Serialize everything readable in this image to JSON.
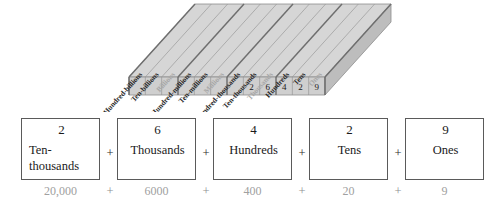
{
  "chart": {
    "name": "place-value-chart",
    "columns": [
      {
        "label": "Hundred-billions",
        "muted": false,
        "digit": ""
      },
      {
        "label": "Ten-billions",
        "muted": false,
        "digit": ""
      },
      {
        "label": "Billions",
        "muted": true,
        "digit": ""
      },
      {
        "label": "Hundred-millions",
        "muted": false,
        "digit": ""
      },
      {
        "label": "Ten-millions",
        "muted": false,
        "digit": ""
      },
      {
        "label": "Millions",
        "muted": true,
        "digit": ""
      },
      {
        "label": "Hundred-thousands",
        "muted": false,
        "digit": ""
      },
      {
        "label": "Ten-thousands",
        "muted": false,
        "digit": "2"
      },
      {
        "label": "Thousands",
        "muted": true,
        "digit": "6"
      },
      {
        "label": "Hundreds",
        "muted": false,
        "digit": "4"
      },
      {
        "label": "Tens",
        "muted": false,
        "digit": "2"
      },
      {
        "label": "Ones",
        "muted": true,
        "digit": "9"
      }
    ]
  },
  "expanded_form": {
    "plus_symbol": "+",
    "terms": [
      {
        "digit": "2",
        "name": "Ten-thousands",
        "value": "20,000"
      },
      {
        "digit": "6",
        "name": "Thousands",
        "value": "6000"
      },
      {
        "digit": "4",
        "name": "Hundreds",
        "value": "400"
      },
      {
        "digit": "2",
        "name": "Tens",
        "value": "20"
      },
      {
        "digit": "9",
        "name": "Ones",
        "value": "9"
      }
    ]
  }
}
